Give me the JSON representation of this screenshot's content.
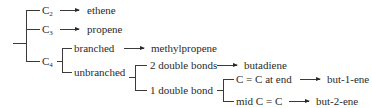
{
  "diagram": {
    "type": "tree",
    "root": {
      "branches": [
        {
          "label": "C",
          "subscript": "2",
          "arrow_to": "ethene"
        },
        {
          "label": "C",
          "subscript": "3",
          "arrow_to": "propene"
        },
        {
          "label": "C",
          "subscript": "4",
          "branches": [
            {
              "label": "branched",
              "arrow_to": "methylpropene"
            },
            {
              "label": "unbranched",
              "branches": [
                {
                  "label": "2 double bonds",
                  "arrow_to": "butadiene"
                },
                {
                  "label": "1 double bond",
                  "branches": [
                    {
                      "label": "C = C at end",
                      "arrow_to": "but-1-ene"
                    },
                    {
                      "label": "mid C = C",
                      "arrow_to": "but-2-ene"
                    }
                  ]
                }
              ]
            }
          ]
        }
      ]
    }
  },
  "labels": {
    "c2_main": "C",
    "c2_sub": "2",
    "ethene": "ethene",
    "c3_main": "C",
    "c3_sub": "3",
    "propene": "propene",
    "c4_main": "C",
    "c4_sub": "4",
    "branched": "branched",
    "methylpropene": "methylpropene",
    "unbranched": "unbranched",
    "two_double_bonds": "2 double bonds",
    "butadiene": "butadiene",
    "one_double_bond": "1 double bond",
    "cc_at_end": "C = C at end",
    "but_1_ene": "but-1-ene",
    "mid_cc": "mid C = C",
    "but_2_ene": "but-2-ene"
  },
  "colors": {
    "line": "#3a3a3a",
    "text": "#2a2a2a",
    "background": "#ffffff"
  }
}
